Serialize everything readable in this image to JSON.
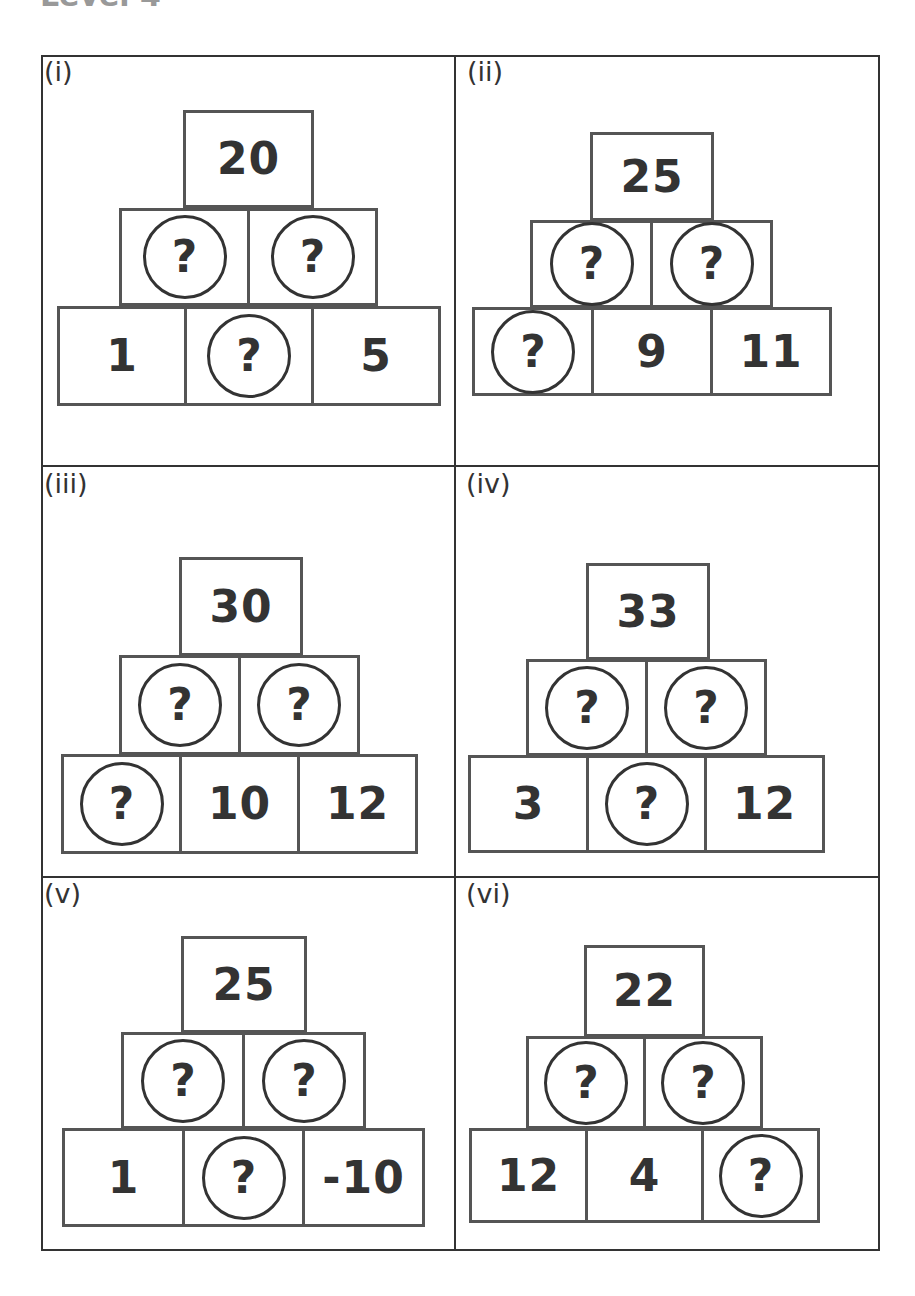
{
  "heading": "Level 4",
  "unknown_symbol": "?",
  "panels": [
    {
      "label": "(i)",
      "top": "20",
      "middle": [
        "?",
        "?"
      ],
      "bottom": [
        "1",
        "?",
        "5"
      ],
      "geom": {
        "label": [
          44,
          58
        ],
        "top": [
          183,
          110,
          131,
          98
        ],
        "mid": [
          119,
          208,
          131,
          98
        ],
        "bot": [
          57,
          306,
          130,
          100
        ]
      }
    },
    {
      "label": "(ii)",
      "top": "25",
      "middle": [
        "?",
        "?"
      ],
      "bottom": [
        "?",
        "9",
        "11"
      ],
      "geom": {
        "label": [
          467,
          58
        ],
        "top": [
          590,
          132,
          124,
          89
        ],
        "mid": [
          530,
          220,
          123,
          88
        ],
        "bot": [
          472,
          307,
          122,
          89
        ]
      }
    },
    {
      "label": "(iii)",
      "top": "30",
      "middle": [
        "?",
        "?"
      ],
      "bottom": [
        "?",
        "10",
        "12"
      ],
      "geom": {
        "label": [
          44,
          470
        ],
        "top": [
          179,
          557,
          124,
          99
        ],
        "mid": [
          119,
          655,
          122,
          100
        ],
        "bot": [
          61,
          754,
          121,
          100
        ]
      }
    },
    {
      "label": "(iv)",
      "top": "33",
      "middle": [
        "?",
        "?"
      ],
      "bottom": [
        "3",
        "?",
        "12"
      ],
      "geom": {
        "label": [
          466,
          470
        ],
        "top": [
          586,
          563,
          124,
          97
        ],
        "mid": [
          526,
          659,
          122,
          97
        ],
        "bot": [
          468,
          755,
          121,
          98
        ]
      }
    },
    {
      "label": "(v)",
      "top": "25",
      "middle": [
        "?",
        "?"
      ],
      "bottom": [
        "1",
        "?",
        "-10"
      ],
      "geom": {
        "label": [
          44,
          880
        ],
        "top": [
          181,
          936,
          126,
          97
        ],
        "mid": [
          121,
          1032,
          124,
          97
        ],
        "bot": [
          62,
          1128,
          123,
          99
        ]
      }
    },
    {
      "label": "(vi)",
      "top": "22",
      "middle": [
        "?",
        "?"
      ],
      "bottom": [
        "12",
        "4",
        "?"
      ],
      "geom": {
        "label": [
          466,
          880
        ],
        "top": [
          584,
          945,
          121,
          92
        ],
        "mid": [
          526,
          1036,
          120,
          93
        ],
        "bot": [
          469,
          1128,
          119,
          95
        ]
      }
    }
  ]
}
